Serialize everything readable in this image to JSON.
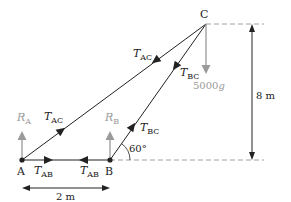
{
  "diagram": {
    "type": "truss free-body diagram",
    "points": {
      "A": {
        "label": "A"
      },
      "B": {
        "label": "B"
      },
      "C": {
        "label": "C"
      }
    },
    "forces": {
      "R_A": {
        "sym": "R",
        "sub": "A"
      },
      "R_B": {
        "sym": "R",
        "sub": "B"
      },
      "T_AC_upper": {
        "sym": "T",
        "sub": "AC"
      },
      "T_AC_lower": {
        "sym": "T",
        "sub": "AC"
      },
      "T_BC_upper": {
        "sym": "T",
        "sub": "BC"
      },
      "T_BC_lower": {
        "sym": "T",
        "sub": "BC"
      },
      "T_AB_left": {
        "sym": "T",
        "sub": "AB"
      },
      "T_AB_right": {
        "sym": "T",
        "sub": "AB"
      },
      "weight": {
        "value": "5000",
        "sym": "g"
      }
    },
    "angle": "60°",
    "dimensions": {
      "horizontal": "2 m",
      "vertical": "8 m"
    },
    "colors": {
      "line": "#222222",
      "gray": "#9a9a9a",
      "dashed": "#a0a0a0"
    }
  }
}
